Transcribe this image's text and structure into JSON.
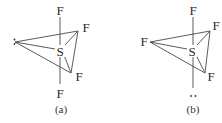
{
  "figure": {
    "panels": [
      {
        "id": "a",
        "caption": "(a)",
        "central_atom": "S",
        "labels": {
          "top": "F",
          "bottom": "F",
          "upper_right": "F",
          "lower_right": "F"
        },
        "equatorial_left": "lone pair (:)",
        "lone_pair_glyph": ":"
      },
      {
        "id": "b",
        "caption": "(b)",
        "central_atom": "S",
        "labels": {
          "top": "F",
          "left": "F",
          "upper_right": "F",
          "lower_right": "F"
        },
        "axial_bottom": "lone pair (..)",
        "lone_pair_glyph": ".."
      }
    ],
    "colors": {
      "line": "#4a4a4a",
      "text": "#2a2a2a",
      "background": "#ffffff"
    }
  }
}
